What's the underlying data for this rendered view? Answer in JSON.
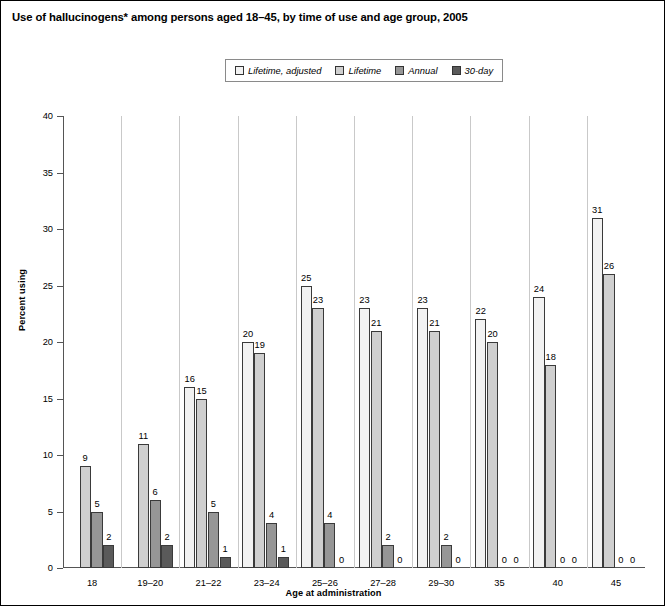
{
  "figure": {
    "title": "Use of hallucinogens* among persons aged 18–45, by time of use and age group, 2005"
  },
  "legend": {
    "position": "top-center",
    "items": [
      {
        "label": "Lifetime, adjusted",
        "color": "#f2f2f2",
        "swatch": "legend-swatch-lifetime-adjusted"
      },
      {
        "label": "Lifetime",
        "color": "#cfcfcf",
        "swatch": "legend-swatch-lifetime"
      },
      {
        "label": "Annual",
        "color": "#969696",
        "swatch": "legend-swatch-annual"
      },
      {
        "label": "30-day",
        "color": "#5a5a5a",
        "swatch": "legend-swatch-30-day"
      }
    ]
  },
  "chart_data": {
    "type": "bar",
    "title": "Use of hallucinogens* among persons aged 18–45, by time of use and age group, 2005",
    "xlabel": "Age at administration",
    "ylabel": "Percent using",
    "ylim": [
      0,
      40
    ],
    "yticks": [
      0,
      5,
      10,
      15,
      20,
      25,
      30,
      35,
      40
    ],
    "ytick_labels": [
      "0",
      "5",
      "10",
      "15",
      "20",
      "25",
      "30",
      "35",
      "40"
    ],
    "grid": false,
    "legend_position": "top-center",
    "categories": [
      "18",
      "19–20",
      "21–22",
      "23–24",
      "25–26",
      "27–28",
      "29–30",
      "35",
      "40",
      "45"
    ],
    "series": [
      {
        "name": "Lifetime, adjusted",
        "color": "#f2f2f2",
        "values": [
          null,
          null,
          16,
          20,
          25,
          23,
          23,
          22,
          24,
          31
        ],
        "labels": [
          "",
          "",
          "16",
          "20",
          "25",
          "23",
          "23",
          "22",
          "24",
          "31"
        ]
      },
      {
        "name": "Lifetime",
        "color": "#cfcfcf",
        "values": [
          9,
          11,
          15,
          19,
          23,
          21,
          21,
          20,
          18,
          26
        ],
        "labels": [
          "9",
          "11",
          "15",
          "19",
          "23",
          "21",
          "21",
          "20",
          "18",
          "26"
        ]
      },
      {
        "name": "Annual",
        "color": "#969696",
        "values": [
          5,
          6,
          5,
          4,
          4,
          2,
          2,
          0,
          0,
          0
        ],
        "labels": [
          "5",
          "6",
          "5",
          "4",
          "4",
          "2",
          "2",
          "0",
          "0",
          "0"
        ]
      },
      {
        "name": "30-day",
        "color": "#5a5a5a",
        "values": [
          2,
          2,
          1,
          1,
          0,
          0,
          0,
          0,
          0,
          0
        ],
        "labels": [
          "2",
          "2",
          "1",
          "1",
          "0",
          "0",
          "0",
          "0",
          "0",
          "0"
        ]
      }
    ]
  }
}
